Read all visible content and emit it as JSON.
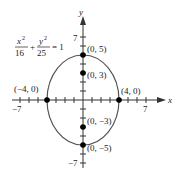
{
  "equation": {
    "x_num": "x",
    "x_den": "16",
    "plus": "+",
    "y_num": "y",
    "y_den": "25",
    "rhs": "= 1"
  },
  "axes": {
    "x_label": "x",
    "y_label": "y",
    "x_min_label": "−7",
    "x_max_label": "7",
    "y_max_label": "7",
    "y_min_label": "−7"
  },
  "points": [
    {
      "label": "(0, 5)"
    },
    {
      "label": "(0, 3)"
    },
    {
      "label": "(−4, 0)"
    },
    {
      "label": "(4, 0)"
    },
    {
      "label": "(0, −3)"
    },
    {
      "label": "(0, −5)"
    }
  ],
  "colors": {
    "curve": "#555555",
    "axis": "#333333",
    "point": "#000000"
  }
}
